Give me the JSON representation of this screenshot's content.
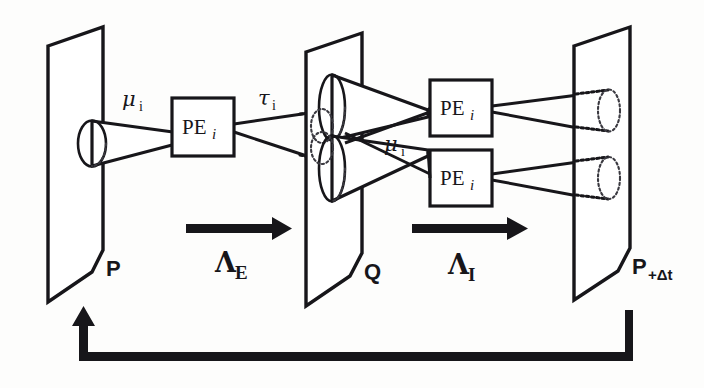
{
  "figure": {
    "kind": "block-diagram",
    "background_color": "#fdfdfc",
    "ink_color": "#17161a"
  },
  "planes": [
    {
      "id": "plane-p",
      "label": "P",
      "label_sub": "",
      "role": "input-layer"
    },
    {
      "id": "plane-q",
      "label": "Q",
      "label_sub": "",
      "role": "intermediate-layer"
    },
    {
      "id": "plane-p-delta",
      "label": "P",
      "label_sub": "+Δt",
      "role": "output-layer"
    }
  ],
  "processing_elements": [
    {
      "id": "pe-left",
      "label": "PE",
      "label_sub": "i"
    },
    {
      "id": "pe-right-upper",
      "label": "PE",
      "label_sub": "i"
    },
    {
      "id": "pe-right-lower",
      "label": "PE",
      "label_sub": "i"
    }
  ],
  "field_labels": [
    {
      "id": "mu-left",
      "symbol": "μ",
      "sub": "i"
    },
    {
      "id": "tau-mid",
      "symbol": "τ",
      "sub": "i"
    },
    {
      "id": "mu-right",
      "symbol": "μ",
      "sub": "i"
    }
  ],
  "transform_arrows": [
    {
      "id": "arrow-lambda-e",
      "symbol": "Λ",
      "sub": "E",
      "direction": "right"
    },
    {
      "id": "arrow-lambda-i",
      "symbol": "Λ",
      "sub": "I",
      "direction": "right"
    }
  ],
  "feedback": {
    "id": "feedback-loop",
    "from": "P+Δt",
    "to": "P",
    "direction": "left-then-up",
    "label": ""
  },
  "receptive_cones": {
    "visible_count": 3,
    "hidden_count": 2,
    "hidden_style": "dotted"
  }
}
